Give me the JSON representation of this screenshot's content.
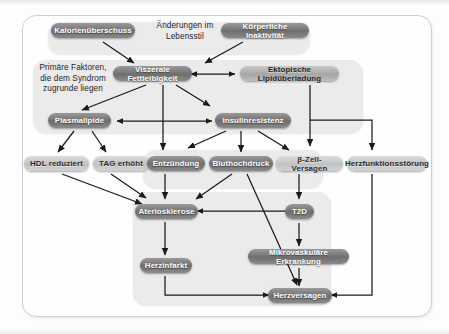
{
  "diagram": {
    "groups": [
      {
        "id": "lifestyle",
        "caption": "Änderungen im\nLebensstil",
        "caption_line1": "Änderungen im",
        "caption_line2": "Lebensstil"
      },
      {
        "id": "primary",
        "caption_line1": "Primäre Faktoren,",
        "caption_line2": "die dem Syndrom",
        "caption_line3": "zugrunde liegen"
      }
    ],
    "nodes": [
      {
        "id": "kalorien",
        "label": "Kalorienüberschuss"
      },
      {
        "id": "inaktivitaet",
        "label": "Körperliche Inaktivität"
      },
      {
        "id": "viszeral",
        "label": "Viszerale Fettleibigkeit"
      },
      {
        "id": "ektopisch",
        "label": "Ektopische Lipidüberladung"
      },
      {
        "id": "plasmalipide",
        "label": "Plasmalipide"
      },
      {
        "id": "insulin",
        "label": "Insulinresistenz"
      },
      {
        "id": "hdl",
        "label": "HDL reduziert"
      },
      {
        "id": "tag",
        "label": "TAG erhöht"
      },
      {
        "id": "entzuendung",
        "label": "Entzündung"
      },
      {
        "id": "bluthochdruck",
        "label": "Bluthochdruck"
      },
      {
        "id": "bzell",
        "label": "β-Zell-Versagen"
      },
      {
        "id": "herzfunktion",
        "label": "Herzfunktionsstörung"
      },
      {
        "id": "atero",
        "label": "Ateriosklerose"
      },
      {
        "id": "t2d",
        "label": "T2D"
      },
      {
        "id": "herzinfarkt",
        "label": "Herzinfarkt"
      },
      {
        "id": "mikrovaskulaer",
        "label": "Mikrovaskuläre Erkrankung"
      },
      {
        "id": "herzversagen",
        "label": "Herzversagen"
      }
    ],
    "edges": [
      {
        "from": "kalorien",
        "to": "viszeral"
      },
      {
        "from": "inaktivitaet",
        "to": "viszeral"
      },
      {
        "from": "viszeral",
        "to": "ektopisch",
        "style": "double"
      },
      {
        "from": "viszeral",
        "to": "plasmalipide"
      },
      {
        "from": "viszeral",
        "to": "insulin"
      },
      {
        "from": "viszeral",
        "to": "entzuendung"
      },
      {
        "from": "plasmalipide",
        "to": "insulin",
        "style": "double"
      },
      {
        "from": "plasmalipide",
        "to": "hdl"
      },
      {
        "from": "plasmalipide",
        "to": "tag"
      },
      {
        "from": "insulin",
        "to": "entzuendung"
      },
      {
        "from": "insulin",
        "to": "bluthochdruck"
      },
      {
        "from": "insulin",
        "to": "bzell"
      },
      {
        "from": "ektopisch",
        "to": "bzell"
      },
      {
        "from": "ektopisch",
        "to": "herzfunktion"
      },
      {
        "from": "hdl",
        "to": "atero"
      },
      {
        "from": "tag",
        "to": "atero"
      },
      {
        "from": "entzuendung",
        "to": "atero"
      },
      {
        "from": "bluthochdruck",
        "to": "atero"
      },
      {
        "from": "bluthochdruck",
        "to": "herzversagen"
      },
      {
        "from": "bzell",
        "to": "t2d"
      },
      {
        "from": "t2d",
        "to": "atero"
      },
      {
        "from": "t2d",
        "to": "mikrovaskulaer"
      },
      {
        "from": "atero",
        "to": "herzinfarkt"
      },
      {
        "from": "herzinfarkt",
        "to": "herzversagen"
      },
      {
        "from": "mikrovaskulaer",
        "to": "herzversagen"
      },
      {
        "from": "herzfunktion",
        "to": "herzversagen"
      }
    ]
  }
}
